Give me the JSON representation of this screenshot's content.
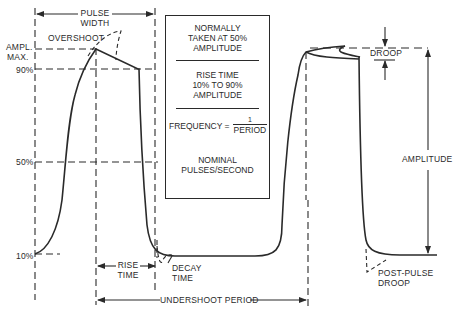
{
  "diagram": {
    "labels": {
      "pulse_width_line1": "PULSE",
      "pulse_width_line2": "WIDTH",
      "overshoot": "OVERSHOOT",
      "ampl_max_line1": "AMPL.",
      "ampl_max_line2": "MAX.",
      "level_90": "90%",
      "level_50": "50%",
      "level_10": "10%",
      "rise_time_line1": "RISE",
      "rise_time_line2": "TIME",
      "decay_time_line1": "DECAY",
      "decay_time_line2": "TIME",
      "undershoot_period": "UNDERSHOOT PERIOD",
      "droop": "DROOP",
      "amplitude": "AMPLITUDE",
      "post_pulse_line1": "POST-PULSE",
      "post_pulse_line2": "DROOP"
    },
    "info_box": {
      "section1": [
        "NORMALLY",
        "TAKEN AT 50%",
        "AMPLITUDE"
      ],
      "section2": [
        "RISE TIME",
        "10% TO 90%",
        "AMPLITUDE"
      ],
      "frequency_label": "FREQUENCY =",
      "frequency_numerator": "1",
      "frequency_denominator": "PERIOD",
      "section4": [
        "NOMINAL",
        "PULSES/SECOND"
      ]
    },
    "colors": {
      "ink": "#2a2a2a",
      "background": "#ffffff"
    }
  }
}
